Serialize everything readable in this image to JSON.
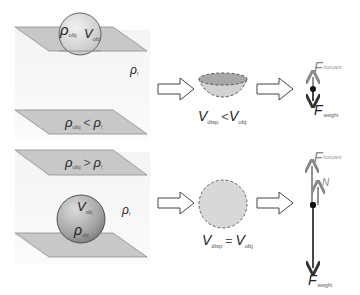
{
  "figure": {
    "colors": {
      "plane_fill": "#c8c8c8",
      "plane_stroke": "#8a8a8a",
      "fluid_bg": "#f7f7f7",
      "sphere_light": "#e6e6e6",
      "sphere_dark": "#9a9a9a",
      "arrow_dark": "#333333",
      "arrow_gray": "#888888"
    }
  },
  "top_panel": {
    "sphere_labels": {
      "rho": "ρ",
      "rho_sub": "obj",
      "v": "V",
      "v_sub": "obj"
    },
    "fluid_label": {
      "rho": "ρ",
      "sub": "f"
    },
    "condition": {
      "left": "ρ",
      "left_sub": "obj",
      "op": "<",
      "right": "ρ",
      "right_sub": "f"
    },
    "displaced_label": {
      "left": "V",
      "left_sub": "disp",
      "op": "<",
      "right": "V",
      "right_sub": "obj"
    },
    "forces": {
      "buoyant": {
        "label": "F",
        "sub": "buoyant"
      },
      "weight": {
        "label": "F",
        "sub": "weight"
      }
    }
  },
  "bottom_panel": {
    "condition": {
      "left": "ρ",
      "left_sub": "obj",
      "op": ">",
      "right": "ρ",
      "right_sub": "f"
    },
    "fluid_label": {
      "rho": "ρ",
      "sub": "f"
    },
    "sphere_labels": {
      "v": "V",
      "v_sub": "obj",
      "rho": "ρ",
      "rho_sub": "obj"
    },
    "displaced_label": {
      "left": "V",
      "left_sub": "disp",
      "op": "=",
      "right": "V",
      "right_sub": "obj"
    },
    "forces": {
      "buoyant": {
        "label": "F",
        "sub": "buoyant"
      },
      "normal": {
        "label": "N"
      },
      "weight": {
        "label": "F",
        "sub": "weight"
      }
    }
  }
}
